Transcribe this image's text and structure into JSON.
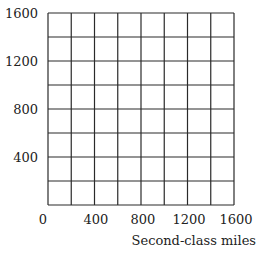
{
  "chart_data": {
    "type": "grid",
    "title": "",
    "xlabel": "Second-class miles",
    "ylabel": "",
    "xlim": [
      0,
      1600
    ],
    "ylim": [
      0,
      1600
    ],
    "x_ticks": [
      "0",
      "400",
      "800",
      "1200",
      "1600"
    ],
    "y_ticks": [
      "400",
      "800",
      "1200",
      "1600"
    ],
    "grid_step": 200,
    "grid": true,
    "series": []
  }
}
